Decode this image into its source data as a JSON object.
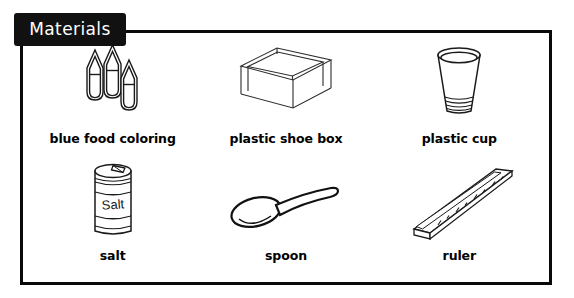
{
  "panel": {
    "badge_label": "Materials",
    "border_color": "#0a0a0a",
    "badge_bg": "#111111",
    "badge_text_color": "#ffffff",
    "background": "#ffffff"
  },
  "items": [
    {
      "id": "blue-food-coloring",
      "label": "blue food coloring",
      "icon": "food-coloring-bottles-icon",
      "row": 1,
      "column": 1
    },
    {
      "id": "plastic-shoe-box",
      "label": "plastic shoe box",
      "icon": "open-box-icon",
      "row": 1,
      "column": 2
    },
    {
      "id": "plastic-cup",
      "label": "plastic cup",
      "icon": "cup-icon",
      "row": 1,
      "column": 3
    },
    {
      "id": "salt",
      "label": "salt",
      "icon": "salt-canister-icon",
      "row": 2,
      "column": 1,
      "can_text": "Salt"
    },
    {
      "id": "spoon",
      "label": "spoon",
      "icon": "spoon-icon",
      "row": 2,
      "column": 2
    },
    {
      "id": "ruler",
      "label": "ruler",
      "icon": "ruler-icon",
      "row": 2,
      "column": 3
    }
  ]
}
